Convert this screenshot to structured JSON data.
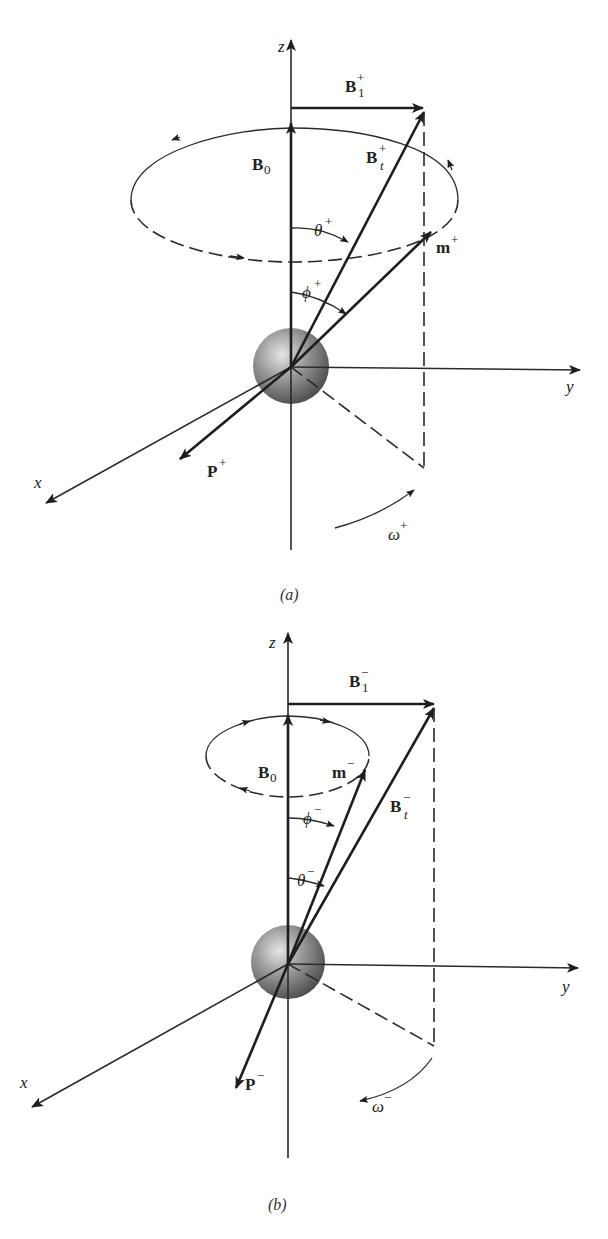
{
  "panels": [
    {
      "id": "a",
      "caption": "(a)",
      "axes": {
        "z": "z",
        "y": "y",
        "x": "x"
      },
      "vectors": {
        "B1": {
          "base": "B",
          "sub": "1",
          "sup": "+"
        },
        "B0": {
          "base": "B",
          "sub": "0"
        },
        "Bt": {
          "base": "B",
          "sub": "t",
          "sup": "+"
        },
        "m": {
          "base": "m",
          "sup": "+"
        },
        "P": {
          "base": "P",
          "sup": "+"
        }
      },
      "angles": {
        "theta": {
          "base": "θ",
          "sup": "+"
        },
        "phi": {
          "base": "ϕ",
          "sup": "+"
        },
        "omega": {
          "base": "ω",
          "sup": "+"
        }
      }
    },
    {
      "id": "b",
      "caption": "(b)",
      "axes": {
        "z": "z",
        "y": "y",
        "x": "x"
      },
      "vectors": {
        "B1": {
          "base": "B",
          "sub": "1",
          "sup": "−"
        },
        "B0": {
          "base": "B",
          "sub": "0"
        },
        "Bt": {
          "base": "B",
          "sub": "t",
          "sup": "−"
        },
        "m": {
          "base": "m",
          "sup": "−"
        },
        "P": {
          "base": "P",
          "sup": "−"
        }
      },
      "angles": {
        "theta": {
          "base": "θ",
          "sup": "−"
        },
        "phi": {
          "base": "ϕ",
          "sup": "−"
        },
        "omega": {
          "base": "ω",
          "sup": "−"
        }
      }
    }
  ]
}
